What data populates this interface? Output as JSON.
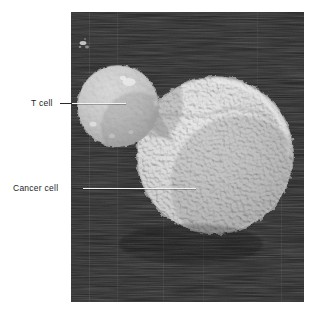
{
  "figure": {
    "kind": "scanning-electron-micrograph",
    "caption_labels": [
      {
        "id": "t-cell",
        "text": "T cell"
      },
      {
        "id": "cancer-cell",
        "text": "Cancer cell"
      }
    ],
    "background_color": "#ffffff",
    "plate_color": "#262626",
    "leader_line_color": "#f2f2f2",
    "label_text_color": "#1e1e1e"
  },
  "labels": {
    "t_cell": "T cell",
    "cancer_cell": "Cancer cell"
  },
  "subjects": {
    "t_cell": {
      "name": "T cell",
      "shape": "sphere",
      "surface": "smooth with scattered blebs",
      "tone": "#b9b9b9"
    },
    "cancer_cell": {
      "name": "Cancer cell",
      "shape": "sphere",
      "surface": "densely covered in microvilli",
      "tone": "#c2c2c2"
    }
  }
}
